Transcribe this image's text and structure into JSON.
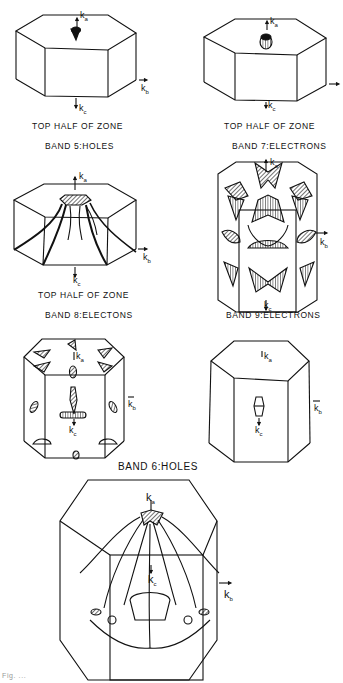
{
  "figure": {
    "panels": [
      {
        "id": "p1",
        "caption1": "TOP HALF OF ZONE",
        "caption2": "BAND 5:HOLES"
      },
      {
        "id": "p2",
        "caption1": "TOP HALF OF ZONE",
        "caption2": "BAND 7:ELECTRONS"
      },
      {
        "id": "p3",
        "caption1": "TOP HALF OF ZONE",
        "caption2": "BAND 8:ELECTONS"
      },
      {
        "id": "p4",
        "caption1": "BAND 9:ELECTRONS"
      },
      {
        "id": "p5"
      },
      {
        "id": "p6"
      },
      {
        "id": "p7"
      }
    ],
    "shared_caption": "BAND 6:HOLES",
    "axes": {
      "ka": "k",
      "ka_sub": "a",
      "kb": "k",
      "kb_sub": "b",
      "kc": "k",
      "kc_sub": "c"
    },
    "footer_fragment": "Fig. ..."
  }
}
